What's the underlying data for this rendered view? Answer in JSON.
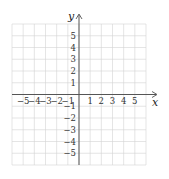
{
  "chart_data": {
    "type": "scatter",
    "title": "",
    "xlabel": "x",
    "ylabel": "y",
    "xlim": [
      -6,
      6
    ],
    "ylim": [
      -6,
      6
    ],
    "grid": true,
    "x_tick_labels": [
      "-5",
      "-4",
      "-3",
      "-2",
      "-1",
      "1",
      "2",
      "3",
      "4",
      "5"
    ],
    "x_ticks": [
      -5,
      -4,
      -3,
      -2,
      -1,
      1,
      2,
      3,
      4,
      5
    ],
    "y_tick_labels": [
      "5",
      "4",
      "3",
      "2",
      "1",
      "-1",
      "-2",
      "-3",
      "-4",
      "-5"
    ],
    "y_ticks": [
      5,
      4,
      3,
      2,
      1,
      -1,
      -2,
      -3,
      -4,
      -5
    ],
    "series": [],
    "colors": {
      "grid": "#d4d4d4",
      "axis": "#555555",
      "text": "#333333"
    }
  }
}
